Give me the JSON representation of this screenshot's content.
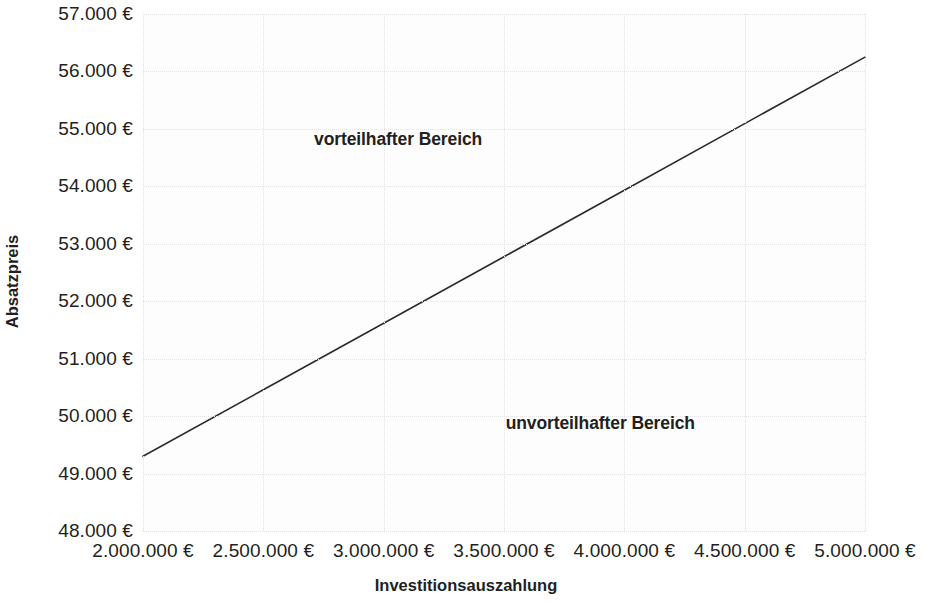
{
  "chart_data": {
    "type": "line",
    "title": "",
    "xlabel": "Investitionsauszahlung",
    "ylabel": "Absatzpreis",
    "xlim": [
      2000000,
      5000000
    ],
    "ylim": [
      48000,
      57000
    ],
    "grid": true,
    "legend": null,
    "x_tick_labels": [
      "2.000.000 €",
      "2.500.000 €",
      "3.000.000 €",
      "3.500.000 €",
      "4.000.000 €",
      "4.500.000 €",
      "5.000.000 €"
    ],
    "x_tick_values": [
      2000000,
      2500000,
      3000000,
      3500000,
      4000000,
      4500000,
      5000000
    ],
    "y_tick_labels": [
      "57.000 €",
      "56.000 €",
      "55.000 €",
      "54.000 €",
      "53.000 €",
      "52.000 €",
      "51.000 €",
      "50.000 €",
      "49.000 €",
      "48.000 €"
    ],
    "y_tick_values": [
      57000,
      56000,
      55000,
      54000,
      53000,
      52000,
      51000,
      50000,
      49000,
      48000
    ],
    "series": [
      {
        "name": "Kritische Absatzpreis-Grenze",
        "color": "#2b2b2b",
        "x": [
          2000000,
          2500000,
          3000000,
          3500000,
          4000000,
          4500000,
          5000000
        ],
        "values": [
          49300,
          50458,
          51617,
          52775,
          53933,
          55092,
          56250
        ]
      }
    ],
    "annotations": [
      {
        "id": "advantageous",
        "text": "vorteilhafter Bereich",
        "x": 3060000,
        "y": 54830
      },
      {
        "id": "disadvantageous",
        "text": "unvorteilhafter Bereich",
        "x": 3900000,
        "y": 49880
      }
    ]
  }
}
